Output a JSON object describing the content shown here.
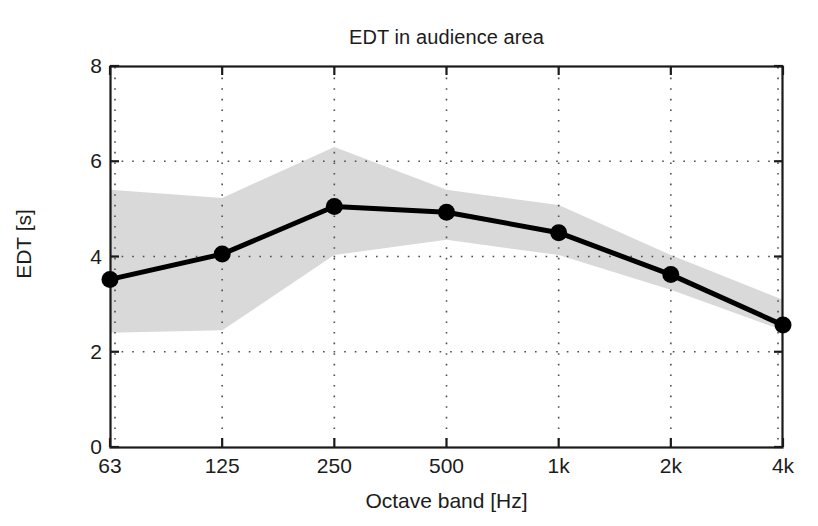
{
  "figure": {
    "background_color": "#ffffff",
    "title": "EDT in audience area"
  },
  "axes": {
    "y_label": "EDT [s]",
    "x_label": "Octave band [Hz]",
    "y_ticks": [
      "0",
      "2",
      "4",
      "6",
      "8"
    ],
    "x_ticks": [
      "63",
      "125",
      "250",
      "500",
      "1k",
      "2k",
      "4k"
    ],
    "frame_color": "#1a1a1a",
    "grid_color": "#4d4d4d"
  },
  "chart_data": {
    "type": "line",
    "title": "EDT in audience area",
    "xlabel": "Octave band [Hz]",
    "ylabel": "EDT [s]",
    "categories": [
      "63",
      "125",
      "250",
      "500",
      "1k",
      "2k",
      "4k"
    ],
    "x_tick_labels": [
      "63",
      "125",
      "250",
      "500",
      "1k",
      "2k",
      "4k"
    ],
    "y_tick_labels": [
      "0",
      "2",
      "4",
      "6",
      "8"
    ],
    "ylim": [
      0,
      8
    ],
    "grid": true,
    "grid_style": "dotted",
    "legend": "none",
    "series": [
      {
        "name": "EDT mean",
        "type": "line",
        "marker": "filled-circle",
        "color": "#000000",
        "line_width": 5,
        "values": [
          3.52,
          4.05,
          5.05,
          4.93,
          4.5,
          3.62,
          2.56
        ]
      },
      {
        "name": "EDT spread band",
        "type": "band",
        "color": "#d9d9d9",
        "upper": [
          5.4,
          5.23,
          6.3,
          5.4,
          5.08,
          4.03,
          3.09
        ],
        "lower": [
          2.4,
          2.45,
          4.03,
          4.35,
          4.03,
          3.3,
          2.45
        ]
      }
    ]
  }
}
